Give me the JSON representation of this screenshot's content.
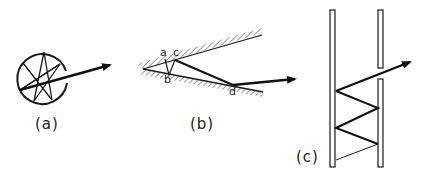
{
  "figure": {
    "panels": [
      {
        "id": "a",
        "label": "(a)",
        "description": "Light ray bouncing inside a circular cavity, exiting through an opening"
      },
      {
        "id": "b",
        "label": "(b)",
        "description": "Ray bouncing between two converging hatched walls",
        "points": [
          "a",
          "b",
          "c",
          "d"
        ]
      },
      {
        "id": "c",
        "label": "(c)",
        "description": "Ray zig-zagging up between two parallel tube walls and exiting through a gap"
      }
    ],
    "colors": {
      "ink": "#1a1a1a",
      "background": "#ffffff"
    }
  }
}
